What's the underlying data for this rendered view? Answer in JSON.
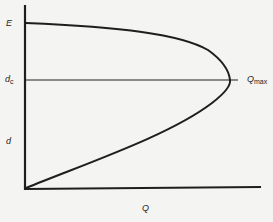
{
  "diagram": {
    "type": "specific-energy-discharge-curve",
    "colors": {
      "background": "#f4f4f2",
      "ink": "#1e1e1e"
    },
    "axes": {
      "x_label": "Q",
      "y_labels": {
        "top": "E",
        "critical_main": "d",
        "critical_sub": "c",
        "middle": "d"
      }
    },
    "annotations": {
      "qmax_main": "Q",
      "qmax_sub": "max"
    },
    "curve": {
      "description": "Parabola-like curve from origin rising to a maximum Q at critical depth d_c, then curving back to E on the vertical axis",
      "points": [
        [
          26,
          188
        ],
        [
          60,
          174
        ],
        [
          100,
          158
        ],
        [
          150,
          140
        ],
        [
          190,
          120
        ],
        [
          215,
          100
        ],
        [
          228,
          88
        ],
        [
          230,
          80
        ],
        [
          228,
          70
        ],
        [
          218,
          58
        ],
        [
          200,
          44
        ],
        [
          160,
          33
        ],
        [
          110,
          27
        ],
        [
          60,
          24
        ],
        [
          26,
          23
        ]
      ]
    },
    "lines": {
      "critical_depth_y": 80,
      "critical_line_x_end": 238
    }
  }
}
